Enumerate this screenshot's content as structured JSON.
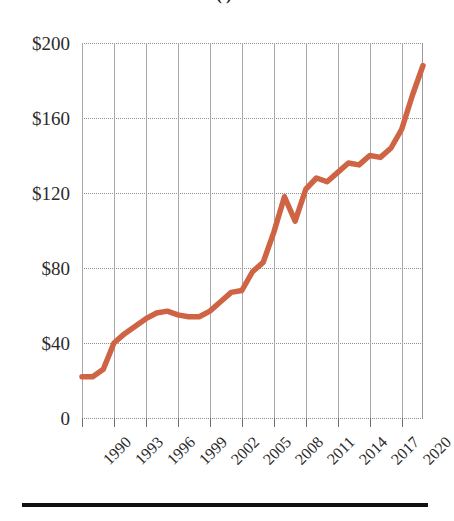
{
  "chart_data": {
    "type": "line",
    "title": "(  )",
    "xlabel": "",
    "ylabel": "",
    "ylim": [
      0,
      200
    ],
    "xlim": [
      1990,
      2022
    ],
    "grid": "both",
    "legend": "none",
    "line_color": "#cf6445",
    "y_ticks": [
      "0",
      "$40",
      "$80",
      "$120",
      "$160",
      "$200"
    ],
    "y_tick_values": [
      0,
      40,
      80,
      120,
      160,
      200
    ],
    "x_ticks": [
      "1990",
      "1993",
      "1996",
      "1999",
      "2002",
      "2005",
      "2008",
      "2011",
      "2014",
      "2017",
      "2020"
    ],
    "x_tick_values": [
      1990,
      1993,
      1996,
      1999,
      2002,
      2005,
      2008,
      2011,
      2014,
      2017,
      2020
    ],
    "x": [
      1990,
      1991,
      1992,
      1993,
      1994,
      1995,
      1996,
      1997,
      1998,
      1999,
      2000,
      2001,
      2002,
      2003,
      2004,
      2005,
      2006,
      2007,
      2008,
      2009,
      2010,
      2011,
      2012,
      2013,
      2014,
      2015,
      2016,
      2017,
      2018,
      2019,
      2020,
      2021,
      2022
    ],
    "values": [
      22,
      22,
      26,
      40,
      45,
      49,
      53,
      56,
      57,
      55,
      54,
      54,
      57,
      62,
      67,
      68,
      78,
      83,
      99,
      118,
      105,
      122,
      128,
      126,
      131,
      136,
      135,
      140,
      139,
      144,
      154,
      172,
      188
    ],
    "series": [
      {
        "name": "value",
        "values": [
          22,
          22,
          26,
          40,
          45,
          49,
          53,
          56,
          57,
          55,
          54,
          54,
          57,
          62,
          67,
          68,
          78,
          83,
          99,
          118,
          105,
          122,
          128,
          126,
          131,
          136,
          135,
          140,
          139,
          144,
          154,
          172,
          188
        ]
      }
    ]
  }
}
